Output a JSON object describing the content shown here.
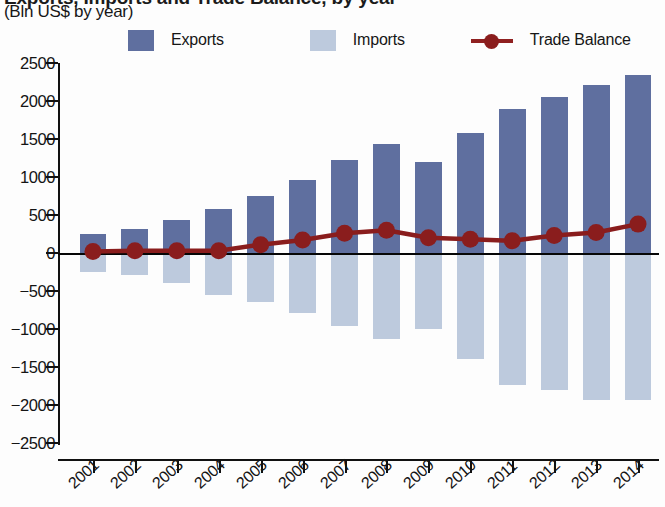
{
  "header": {
    "title_clipped": "Exports, Imports and Trade Balance, by year",
    "subtitle": "(Bln US$ by year)"
  },
  "legend": {
    "items": [
      {
        "label": "Exports",
        "marker": "square-swatch",
        "color": "#5f6f9f"
      },
      {
        "label": "Imports",
        "marker": "square-swatch",
        "color": "#bdcadd"
      },
      {
        "label": "Trade Balance",
        "marker": "line-with-dot",
        "color": "#8a1d1d"
      }
    ]
  },
  "chart_data": {
    "type": "bar",
    "title": "Exports, Imports and Trade Balance, by year",
    "subtitle": "(Bln US$ by year)",
    "xlabel": "",
    "ylabel": "(Bln US$ by year)",
    "ylim": [
      -2500,
      2500
    ],
    "ytick_step": 500,
    "yticks": [
      2500,
      2000,
      1500,
      1000,
      500,
      0,
      -500,
      -1000,
      -1500,
      -2000,
      -2500
    ],
    "ytick_labels": [
      "2500",
      "2000",
      "1500",
      "1000",
      "500",
      "0",
      "−500",
      "−1000",
      "−1500",
      "−2000",
      "−2500"
    ],
    "categories": [
      "2001",
      "2002",
      "2003",
      "2004",
      "2005",
      "2006",
      "2007",
      "2008",
      "2009",
      "2010",
      "2011",
      "2012",
      "2013",
      "2014"
    ],
    "grid": false,
    "legend_position": "top",
    "series": [
      {
        "name": "Exports",
        "type": "bar",
        "color": "#5f6f9f",
        "values": [
          250,
          310,
          430,
          580,
          750,
          960,
          1220,
          1430,
          1200,
          1580,
          1900,
          2050,
          2210,
          2340
        ]
      },
      {
        "name": "Imports",
        "type": "bar",
        "color": "#bdcadd",
        "values": [
          -250,
          -290,
          -400,
          -550,
          -640,
          -790,
          -960,
          -1130,
          -1000,
          -1400,
          -1740,
          -1800,
          -1940,
          -1930
        ]
      },
      {
        "name": "Trade Balance",
        "type": "line",
        "color": "#8a1d1d",
        "values": [
          20,
          30,
          30,
          30,
          110,
          170,
          260,
          300,
          200,
          180,
          160,
          230,
          270,
          380
        ]
      }
    ]
  }
}
